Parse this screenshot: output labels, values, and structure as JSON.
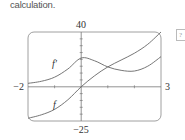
{
  "caption": "calculation.",
  "side_box": "?",
  "chart_data": {
    "type": "line",
    "title": "",
    "xlabel": "",
    "ylabel": "",
    "xlim": [
      -2,
      3
    ],
    "ylim": [
      -25,
      40
    ],
    "tick_labels": {
      "x_left": "−2",
      "x_right": "3",
      "y_top": "40",
      "y_bottom": "−25"
    },
    "grid": false,
    "legend": "none (curves labeled inline)",
    "series": [
      {
        "name": "f",
        "label": "f",
        "x": [
          -2,
          -1.5,
          -1,
          -0.5,
          0,
          0.5,
          1,
          1.5,
          2,
          2.5,
          3
        ],
        "values": [
          -23,
          -20.5,
          -16.5,
          -9.5,
          0,
          8,
          14.5,
          19.5,
          24.5,
          31,
          40
        ]
      },
      {
        "name": "f'",
        "label": "f′",
        "x": [
          -2,
          -1.5,
          -1,
          -0.5,
          0,
          0.5,
          1,
          1.5,
          2,
          2.5,
          3
        ],
        "values": [
          2.5,
          4,
          7,
          13,
          21,
          19,
          14.5,
          12,
          11.5,
          15,
          22
        ]
      }
    ]
  }
}
